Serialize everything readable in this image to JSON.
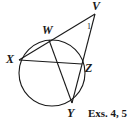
{
  "diagram": {
    "points": {
      "V": "V",
      "W": "W",
      "X": "X",
      "Y": "Y",
      "Z": "Z"
    },
    "angle_label": "1",
    "caption": "Exs. 4, 5",
    "segments": [
      "VX",
      "VY",
      "XZ",
      "WY"
    ],
    "circle_through": [
      "W",
      "X",
      "Y",
      "Z"
    ],
    "colors": {
      "ink": "#1a1a1a",
      "background": "#ffffff"
    }
  }
}
